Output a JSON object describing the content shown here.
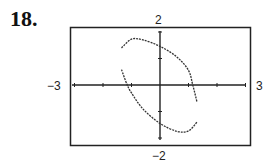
{
  "problem": {
    "number": "18."
  },
  "chart_data": {
    "type": "line",
    "title": "",
    "xlabel": "",
    "ylabel": "",
    "xlim": [
      -3,
      3
    ],
    "ylim": [
      -2,
      2
    ],
    "x_tick_step": 1,
    "y_tick_step": 1,
    "grid": false,
    "window_labels": {
      "xmin": "−3",
      "xmax": "3",
      "ymin": "−2",
      "ymax": "2"
    },
    "series": [
      {
        "name": "upper branch",
        "points": [
          [
            -1.35,
            1.4
          ],
          [
            -1.0,
            1.73
          ],
          [
            -0.6,
            1.7
          ],
          [
            0.0,
            1.46
          ],
          [
            0.6,
            1.05
          ],
          [
            1.0,
            0.55
          ],
          [
            1.15,
            0.0
          ],
          [
            1.3,
            -0.65
          ]
        ]
      },
      {
        "name": "lower branch",
        "points": [
          [
            -1.35,
            0.58
          ],
          [
            -1.15,
            0.0
          ],
          [
            -1.0,
            -0.3
          ],
          [
            -0.6,
            -0.9
          ],
          [
            0.0,
            -1.45
          ],
          [
            0.6,
            -1.75
          ],
          [
            1.0,
            -1.73
          ],
          [
            1.3,
            -1.4
          ]
        ]
      }
    ],
    "colors": {
      "curve": "#333333",
      "axes": "#222222",
      "frame": "#222222"
    }
  }
}
